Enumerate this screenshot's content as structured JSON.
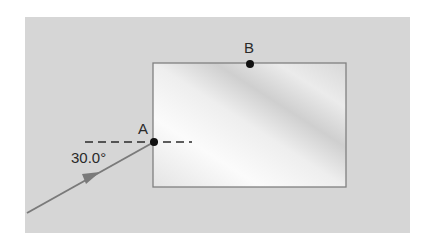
{
  "diagram": {
    "type": "refraction-ray-diagram",
    "colors": {
      "page_background": "#ffffff",
      "medium_background": "#d6d6d6",
      "block_fill_light": "#f6f6f6",
      "block_fill_dark": "#cdcdcd",
      "block_border": "#808080",
      "ray": "#7a7a7a",
      "normal_line": "#2a2a2a",
      "point": "#111111",
      "text": "#2a2a2a"
    },
    "background_region": {
      "x": 25,
      "y": 17,
      "width": 385,
      "height": 216
    },
    "block": {
      "x": 153,
      "y": 63,
      "width": 193,
      "height": 124
    },
    "points": [
      {
        "id": "A",
        "label": "A",
        "x": 154,
        "y": 142,
        "label_x": 143,
        "label_y": 134
      },
      {
        "id": "B",
        "label": "B",
        "x": 250,
        "y": 64,
        "label_x": 249,
        "label_y": 53
      }
    ],
    "normal": {
      "x1": 85,
      "y1": 142,
      "x2": 192,
      "y2": 142,
      "style": "dashed"
    },
    "incident_ray": {
      "from": {
        "x": 27,
        "y": 213
      },
      "to": {
        "x": 154,
        "y": 142
      },
      "arrow_at": {
        "x": 93,
        "y": 176
      }
    },
    "angle_label": {
      "text": "30.0°",
      "x": 71,
      "y": 163,
      "value_deg": 30.0
    }
  }
}
